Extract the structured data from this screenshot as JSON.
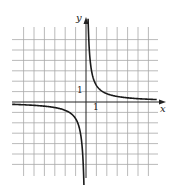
{
  "chart_data": {
    "type": "line",
    "title": "",
    "xlabel": "x",
    "ylabel": "y",
    "function": "y = k/x (rectangular hyperbola, branches in quadrants I and III)",
    "k": 1.6,
    "asymptotes": {
      "vertical": "x = 0",
      "horizontal": "y = 0"
    },
    "xlim": [
      -7,
      7
    ],
    "ylim": [
      -7,
      7
    ],
    "grid": true,
    "grid_step": 1,
    "tick_labels": {
      "x": [
        "1"
      ],
      "y": [
        "1"
      ]
    },
    "series": [
      {
        "name": "right branch",
        "x": [
          0.23,
          0.25,
          0.5,
          1,
          2,
          3,
          4,
          5,
          6,
          7
        ],
        "y": [
          7.0,
          6.4,
          3.2,
          1.6,
          0.8,
          0.53,
          0.4,
          0.32,
          0.27,
          0.23
        ]
      },
      {
        "name": "left branch",
        "x": [
          -7,
          -6,
          -5,
          -4,
          -3,
          -2,
          -1,
          -0.5,
          -0.25,
          -0.21
        ],
        "y": [
          -0.23,
          -0.27,
          -0.32,
          -0.4,
          -0.53,
          -0.8,
          -1.6,
          -3.2,
          -6.4,
          -7.5
        ]
      }
    ]
  },
  "labels": {
    "x_axis": "x",
    "y_axis": "y",
    "x_tick": "1",
    "y_tick": "1"
  },
  "colors": {
    "grid": "#a8a8a8",
    "axis": "#222222",
    "curve": "#1a1a1a",
    "background": "#ffffff"
  }
}
